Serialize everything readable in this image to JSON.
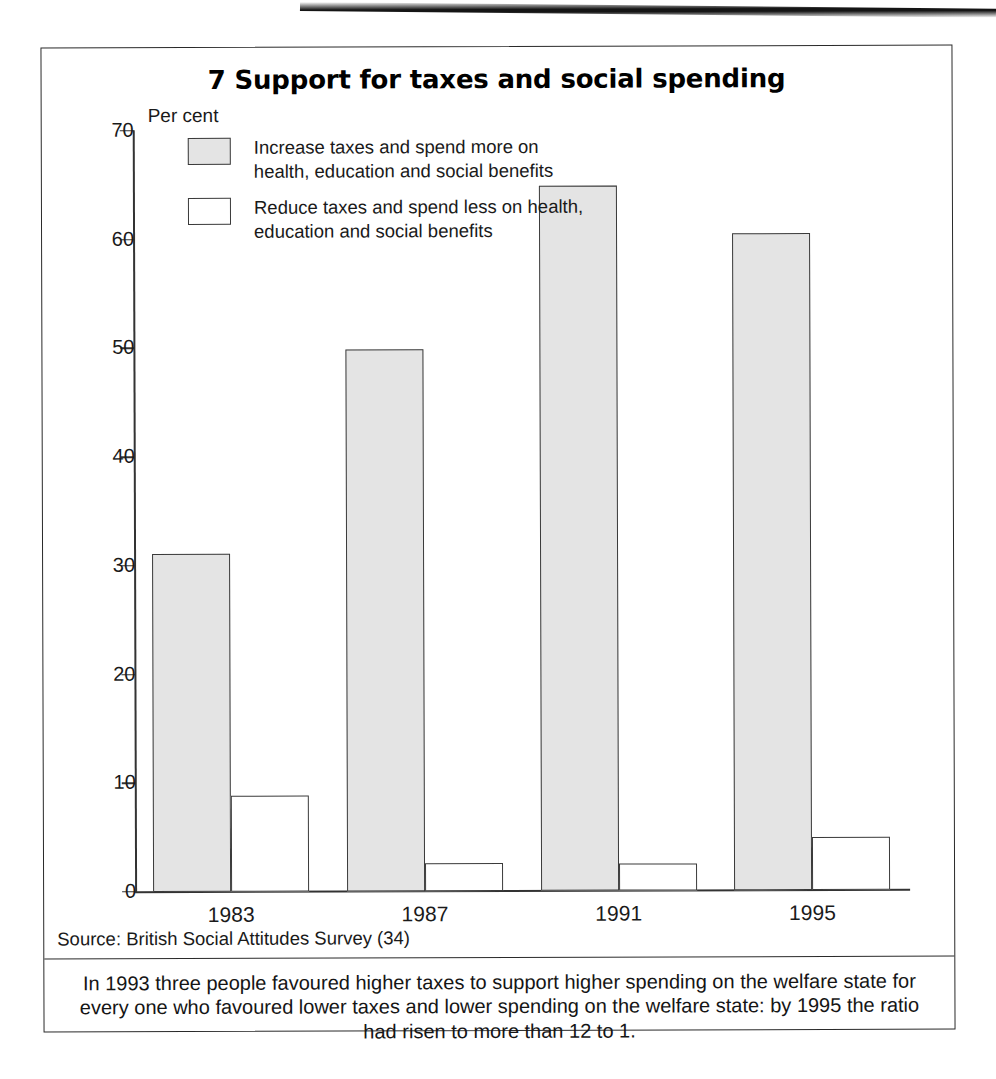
{
  "figure": {
    "title": "7 Support for taxes and social spending",
    "source": "Source: British Social Attitudes Survey (34)",
    "caption": "In 1993 three people favoured higher taxes to support higher spending on the welfare state for every one who favoured lower taxes and lower spending on the welfare state: by 1995 the ratio had risen to more than 12 to 1."
  },
  "chart_data": {
    "type": "bar",
    "title": "7 Support for taxes and social spending",
    "xlabel": "",
    "ylabel": "Per cent",
    "ylim": [
      0,
      70
    ],
    "yticks": [
      0,
      10,
      20,
      30,
      40,
      50,
      60,
      70
    ],
    "ytick_labels": [
      "0",
      "10",
      "20",
      "30",
      "40",
      "50",
      "60",
      "70"
    ],
    "categories": [
      "1983",
      "1987",
      "1991",
      "1995"
    ],
    "grid": false,
    "legend_position": "upper-left-inside",
    "series": [
      {
        "name": "Increase taxes and spend more on health, education and social benefits",
        "color": "#e4e4e4",
        "values": [
          31.0,
          49.8,
          64.8,
          60.3
        ]
      },
      {
        "name": "Reduce taxes and spend less on health, education and social benefits",
        "color": "#ffffff",
        "values": [
          8.7,
          2.5,
          2.4,
          4.8
        ]
      }
    ],
    "legend": [
      {
        "label_line1": "Increase taxes and spend more on",
        "label_line2": "health, education and social benefits",
        "swatch": "grey"
      },
      {
        "label_line1": "Reduce taxes and spend less on health,",
        "label_line2": "education and social benefits",
        "swatch": "white"
      }
    ]
  }
}
